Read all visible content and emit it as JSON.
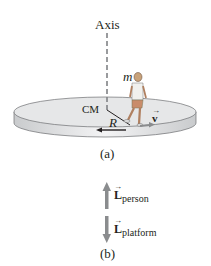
{
  "figure_a": {
    "axis_label": "Axis",
    "mass_label": "m",
    "cm_label": "CM",
    "radius_label": "R",
    "velocity_label": "v",
    "caption": "(a)"
  },
  "figure_b": {
    "L_person_symbol": "L",
    "L_person_sub": "person",
    "L_platform_symbol": "L",
    "L_platform_sub": "platform",
    "caption": "(b)"
  },
  "colors": {
    "platform_top": "#e6e7e8",
    "platform_side": "#cfd1d3",
    "vector_gray": "#8a8c8e",
    "text": "#231f20"
  }
}
